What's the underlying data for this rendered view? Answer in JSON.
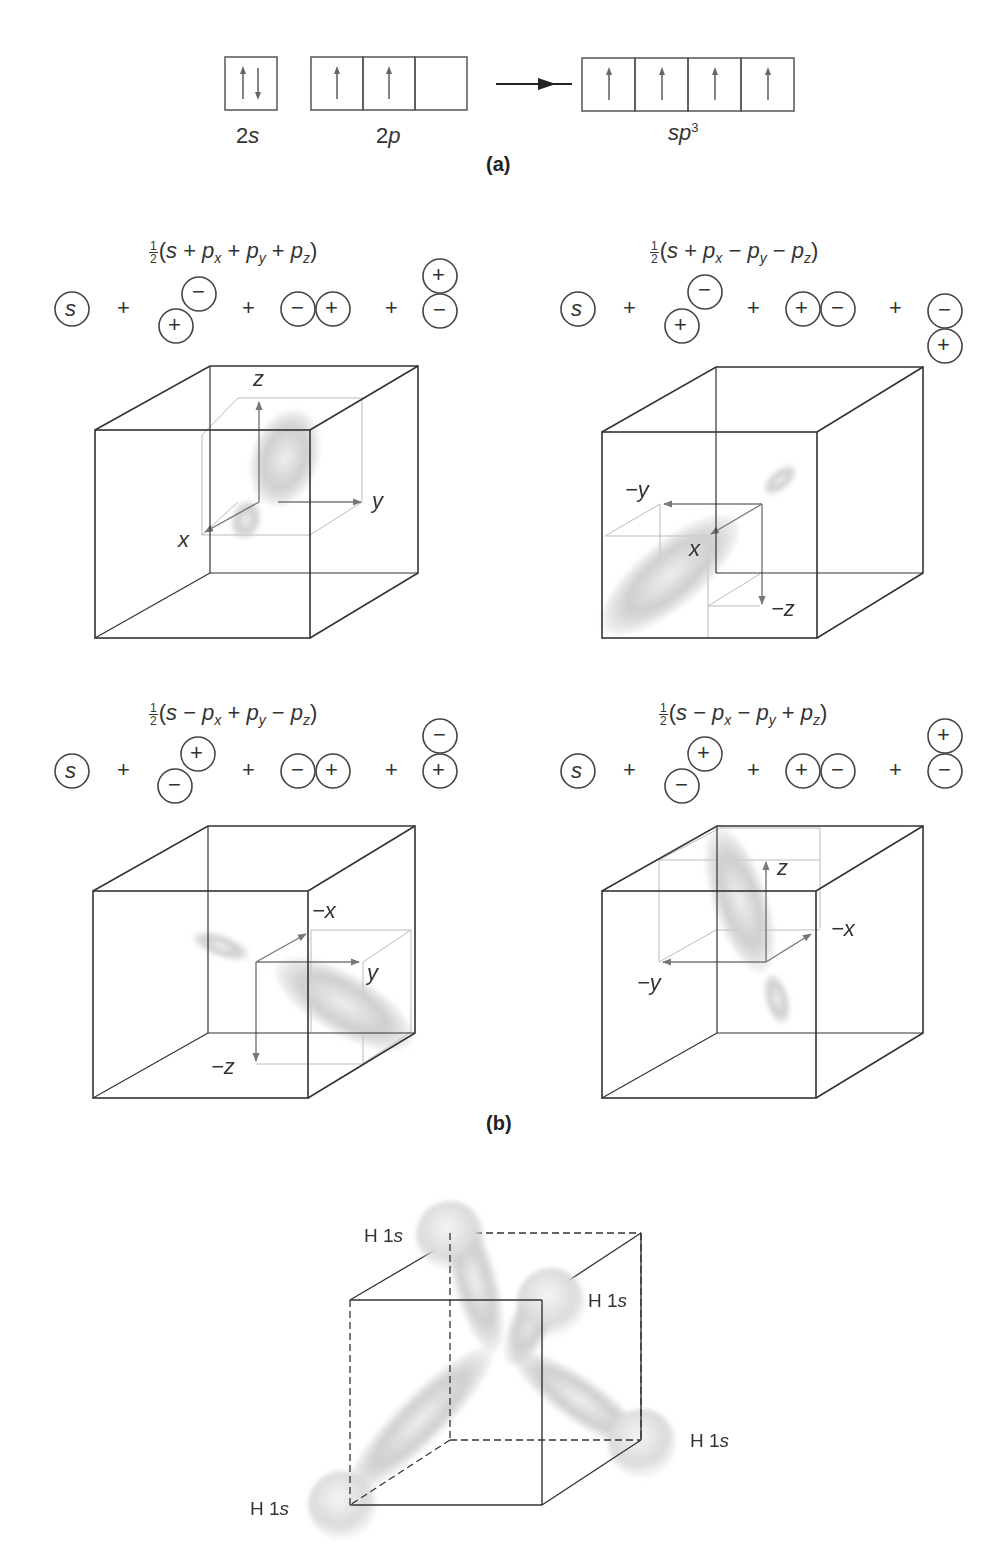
{
  "panel_a": {
    "label": "(a)",
    "groups": [
      {
        "name": "2s",
        "label_main": "2",
        "label_it": "s",
        "boxes": [
          "↑↓"
        ]
      },
      {
        "name": "2p",
        "label_main": "2",
        "label_it": "p",
        "boxes": [
          "↑",
          "↑",
          ""
        ]
      },
      {
        "name": "sp3",
        "label_main": "",
        "label_it": "sp",
        "sup": "3",
        "boxes": [
          "↑",
          "↑",
          "↑",
          "↑"
        ]
      }
    ],
    "arrow": "→"
  },
  "panel_b": {
    "label": "(b)",
    "hybrids": [
      {
        "formula_prefix": "(",
        "formula": "s + p_x + p_y + p_z",
        "terms": [
          "s",
          "+",
          "p_x",
          "+",
          "p_y",
          "+",
          "p_z"
        ],
        "frac_num": "1",
        "frac_den": "2",
        "px_signs": {
          "lower": "+",
          "upper": "−"
        },
        "py_signs": {
          "left": "−",
          "right": "+"
        },
        "pz_signs": {
          "top": "+",
          "bottom": "−"
        },
        "axes": {
          "a1": "z",
          "a2": "y",
          "a3": "x"
        }
      },
      {
        "formula": "s + p_x − p_y − p_z",
        "terms": [
          "s",
          "+",
          "p_x",
          "−",
          "p_y",
          "−",
          "p_z"
        ],
        "frac_num": "1",
        "frac_den": "2",
        "px_signs": {
          "lower": "+",
          "upper": "−"
        },
        "py_signs": {
          "left": "+",
          "right": "−"
        },
        "pz_signs": {
          "top": "−",
          "bottom": "+"
        },
        "axes": {
          "a1": "−y",
          "a2": "x",
          "a3": "−z"
        }
      },
      {
        "formula": "s − p_x + p_y − p_z",
        "terms": [
          "s",
          "−",
          "p_x",
          "+",
          "p_y",
          "−",
          "p_z"
        ],
        "frac_num": "1",
        "frac_den": "2",
        "px_signs": {
          "lower": "−",
          "upper": "+"
        },
        "py_signs": {
          "left": "−",
          "right": "+"
        },
        "pz_signs": {
          "top": "−",
          "bottom": "+"
        },
        "axes": {
          "a1": "−x",
          "a2": "y",
          "a3": "−z"
        }
      },
      {
        "formula": "s − p_x − p_y + p_z",
        "terms": [
          "s",
          "−",
          "p_x",
          "−",
          "p_y",
          "+",
          "p_z"
        ],
        "frac_num": "1",
        "frac_den": "2",
        "px_signs": {
          "lower": "−",
          "upper": "+"
        },
        "py_signs": {
          "left": "+",
          "right": "−"
        },
        "pz_signs": {
          "top": "+",
          "bottom": "−"
        },
        "axes": {
          "a1": "z",
          "a2": "−x",
          "a3": "−y"
        }
      }
    ],
    "s_label": "s",
    "plus": "+"
  },
  "panel_c": {
    "h_labels": [
      "H 1s",
      "H 1s",
      "H 1s",
      "H 1s"
    ],
    "h_prefix": "H 1",
    "h_suffix": "s"
  }
}
